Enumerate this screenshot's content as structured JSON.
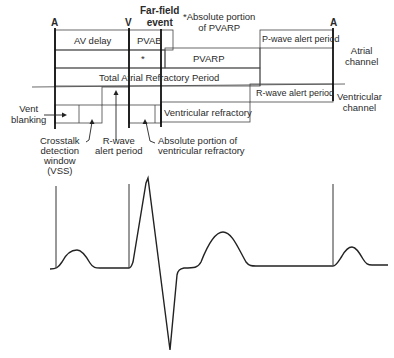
{
  "markers": {
    "atrial_left": "A",
    "ventricular": "V",
    "far_field": "Far-field\nevent",
    "atrial_right": "A"
  },
  "note": "*Absolute portion\nof PVARP",
  "atrial_channel": {
    "label": "Atrial\nchannel",
    "boxes": {
      "av_delay": "AV delay",
      "pvab": "PVAB",
      "asterisk": "*",
      "pvarp": "PVARP",
      "tarp": "Total Atrial Refractory Period",
      "p_wave_alert": "P-wave alert period"
    }
  },
  "ventricular_channel": {
    "label": "Ventricular\nchannel",
    "boxes": {
      "ventricular_refractory": "Ventricular refractory",
      "r_wave_alert": "R-wave alert period"
    }
  },
  "annotations": {
    "vent_blanking": "Vent\nblanking",
    "crosstalk": "Crosstalk\ndetection\nwindow\n(VSS)",
    "r_wave_alert": "R-wave\nalert period",
    "absolute_vent_refractory": "Absolute portion of\nventricular refractory"
  },
  "colors": {
    "line": "#1a1a1a",
    "thin_line": "#444444",
    "text": "#2a2a2a"
  }
}
